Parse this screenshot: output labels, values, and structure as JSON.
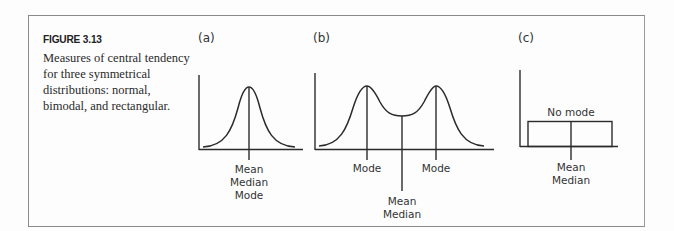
{
  "figure": {
    "title": "FIGURE 3.13",
    "caption": "Measures of central tendency for three symmetrical distributions: normal, bimodal, and rectangular."
  },
  "panels": [
    {
      "id": "a",
      "label": "(a)",
      "distribution": "normal",
      "labels": [
        "Mean",
        "Median",
        "Mode"
      ]
    },
    {
      "id": "b",
      "label": "(b)",
      "distribution": "bimodal",
      "mode_left": "Mode",
      "mode_right": "Mode",
      "center_labels": [
        "Mean",
        "Median"
      ]
    },
    {
      "id": "c",
      "label": "(c)",
      "distribution": "rectangular",
      "top_label": "No mode",
      "labels": [
        "Mean",
        "Median"
      ]
    }
  ],
  "colors": {
    "line": "#2b2b2b",
    "frame": "#8a8a8a",
    "text": "#333333"
  }
}
